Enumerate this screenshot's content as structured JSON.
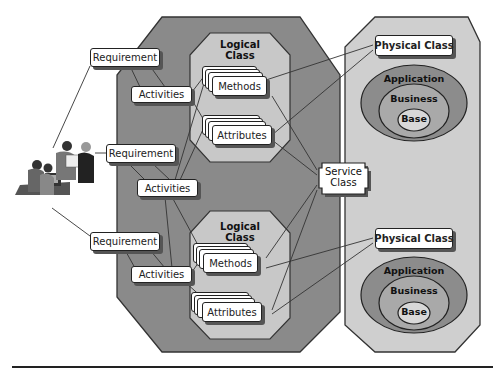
{
  "diagram": {
    "requirements": [
      {
        "label": "Requirement"
      },
      {
        "label": "Requirement"
      },
      {
        "label": "Requirement"
      }
    ],
    "activities": [
      {
        "label": "Activities"
      },
      {
        "label": "Activities"
      },
      {
        "label": "Activities"
      }
    ],
    "logical_classes": [
      {
        "title_line1": "Logical",
        "title_line2": "Class",
        "methods": "Methods",
        "attributes": "Attributes"
      },
      {
        "title_line1": "Logical",
        "title_line2": "Class",
        "methods": "Methods",
        "attributes": "Attributes"
      }
    ],
    "service_class": {
      "line1": "Service",
      "line2": "Class"
    },
    "physical_classes": [
      {
        "label": "Physical Class",
        "layers": {
          "outer": "Application",
          "middle": "Business",
          "inner": "Base"
        }
      },
      {
        "label": "Physical Class",
        "layers": {
          "outer": "Application",
          "middle": "Business",
          "inner": "Base"
        }
      }
    ],
    "people_illustration": "team-of-people-icon",
    "colors": {
      "outer_octagon": "#8a8a8a",
      "inner_octagon": "#c8c8c8",
      "physical_panel": "#cfcfcf",
      "ellipse_outer": "#8c8c8c",
      "ellipse_middle": "#a9a9a9",
      "ellipse_inner": "#d8d8d8",
      "box_fill": "#ffffff",
      "line": "#333333"
    }
  }
}
